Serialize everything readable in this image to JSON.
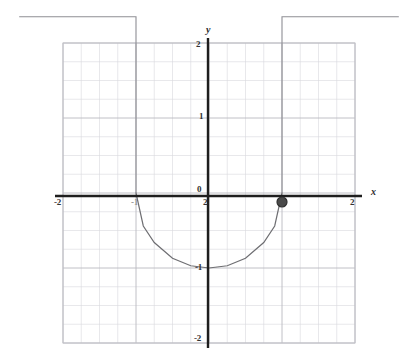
{
  "figure": {
    "kind": "cartesian-graph",
    "background": "#ffffff",
    "ink": "#2b2b2b",
    "grid_color": "#d9d9dd",
    "grid_major_color": "#b9b9c0",
    "curve_color": "#6e6e72",
    "point_color": "#4a4a4a"
  },
  "axes": {
    "x_axis_label": "x",
    "y_axis_label": "y",
    "x_ticks": [
      {
        "label": "-2",
        "value": -2
      },
      {
        "label": "-1",
        "value": -1
      },
      {
        "label": "0",
        "value": 0
      },
      {
        "label": "2",
        "value": 2
      }
    ],
    "y_ticks": [
      {
        "label": "2",
        "value": 2
      },
      {
        "label": "1",
        "value": 1
      },
      {
        "label": "0",
        "value": 0
      },
      {
        "label": "-1",
        "value": -1
      },
      {
        "label": "-2",
        "value": -2
      }
    ]
  },
  "chart_data": {
    "type": "line",
    "title": "",
    "xlabel": "x",
    "ylabel": "y",
    "xlim": [
      -2,
      2
    ],
    "ylim": [
      -2,
      2
    ],
    "grid": true,
    "minor_grid_step": 0.25,
    "major_grid_step": 1,
    "legend": "none",
    "series": [
      {
        "name": "lower-arc",
        "description": "semicircular arc dipping below the x-axis between x = -1 and x = 1",
        "x": [
          -1,
          -0.9,
          -0.75,
          -0.5,
          -0.25,
          0,
          0.25,
          0.5,
          0.75,
          0.9,
          1
        ],
        "y": [
          0,
          -0.44,
          -0.66,
          -0.87,
          -0.97,
          -1,
          -0.97,
          -0.87,
          -0.66,
          -0.44,
          0
        ]
      },
      {
        "name": "left-branch",
        "description": "horizontal ray at y = 2.35 running from the left edge to x = -1, then dropping vertically along x = -1",
        "x": [
          -2.6,
          -1,
          -1
        ],
        "y": [
          2.35,
          2.35,
          0
        ]
      },
      {
        "name": "right-branch",
        "description": "vertical ray along x = 1 rising from y = 0 to y = 2.35, then running horizontally to the right edge",
        "x": [
          1,
          1,
          2.6
        ],
        "y": [
          0,
          2.35,
          2.35
        ]
      }
    ],
    "points": [
      {
        "name": "marked-point",
        "x": 1,
        "y": -0.12,
        "style": "filled-circle"
      }
    ]
  }
}
